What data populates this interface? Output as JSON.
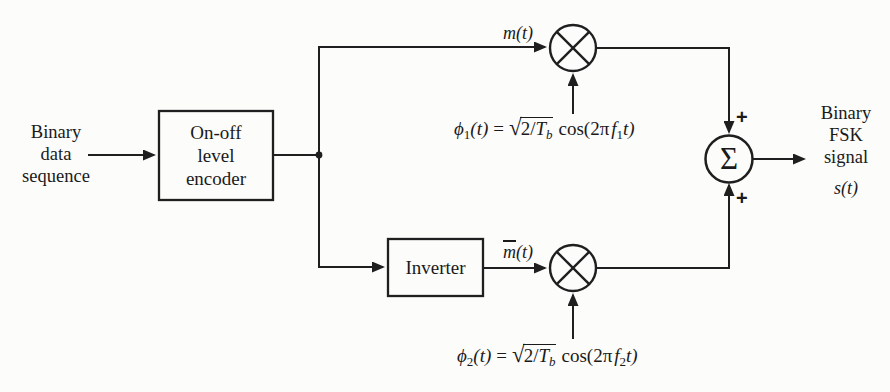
{
  "colors": {
    "line": "#1f1f1f",
    "text": "#1a1a1a",
    "background": "#fcfcfb"
  },
  "labels": {
    "input": "Binary\ndata\nsequence",
    "encoder": "On-off\nlevel\nencoder",
    "inverter": "Inverter",
    "m_signal": "m(t)",
    "mbar_m": "m",
    "mbar_rest": "(t)",
    "sigma": "Σ",
    "plus_top": "+",
    "plus_bottom": "+",
    "output": "Binary\nFSK\nsignal",
    "s_signal": "s(t)"
  },
  "formulas": {
    "phi1": {
      "phi": "ϕ",
      "phi_sub": "1",
      "args": "(t)",
      "equals": "=",
      "sqrt": "√",
      "radicand_num": "2/",
      "radicand_T": "T",
      "radicand_sub": "b",
      "cos": "cos(2π",
      "f": "f",
      "f_sub": "1",
      "tail": "t)"
    },
    "phi2": {
      "phi": "ϕ",
      "phi_sub": "2",
      "args": "(t)",
      "equals": "=",
      "sqrt": "√",
      "radicand_num": "2/",
      "radicand_T": "T",
      "radicand_sub": "b",
      "cos": "cos(2π",
      "f": "f",
      "f_sub": "2",
      "tail": "t)"
    }
  }
}
